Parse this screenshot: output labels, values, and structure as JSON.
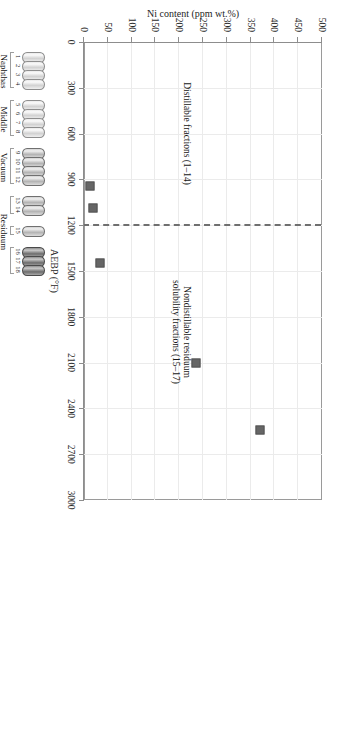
{
  "chart_data": {
    "type": "scatter",
    "title": "",
    "xlabel": "AEBP (°F)",
    "ylabel": "Ni content (ppm wt.%)",
    "xlim": [
      0,
      3000
    ],
    "ylim": [
      0,
      500
    ],
    "xticks": [
      0,
      300,
      600,
      900,
      1200,
      1500,
      1800,
      2100,
      2400,
      2700,
      3000
    ],
    "yticks": [
      0,
      50,
      100,
      150,
      200,
      250,
      300,
      350,
      400,
      450,
      500
    ],
    "grid": true,
    "legend": "none",
    "orientation": "rotated-90",
    "points": [
      {
        "label": "18",
        "x": 2540,
        "y": 370
      },
      {
        "label": "17",
        "x": 2100,
        "y": 235
      },
      {
        "label": "16",
        "x": 1450,
        "y": 33
      },
      {
        "label": "15",
        "x": 1090,
        "y": 18
      },
      {
        "label": "14",
        "x": 940,
        "y": 12
      }
    ],
    "annotations": [
      {
        "id": "nondistillable",
        "text_line1": "Nondistillable residuum",
        "text_line2": "solubility fractions (15–17)",
        "x": 1900,
        "y": 215
      },
      {
        "id": "distillable",
        "text_line1": "Distillable fractions (1–14)",
        "text_line2": "",
        "x": 600,
        "y": 215
      }
    ],
    "divider": {
      "type": "dashed-vertical",
      "x": 1200
    }
  },
  "diagram": {
    "header_line1": "Crude oil",
    "header_line2": "fractions",
    "groups": [
      {
        "id": "naphthas",
        "label_line1": "Naphthas",
        "label_line2": "",
        "numbers": [
          "1",
          "2",
          "3",
          "4"
        ],
        "shade": "light"
      },
      {
        "id": "middle-distillates",
        "label_line1": "Middle",
        "label_line2": "distillates",
        "numbers": [
          "5",
          "6",
          "7",
          "8"
        ],
        "shade": "light"
      },
      {
        "id": "vacuum-gas-oils",
        "label_line1": "Vacuum",
        "label_line2": "gas oils",
        "numbers": [
          "9",
          "10",
          "11",
          "12"
        ],
        "shade": "mid"
      },
      {
        "id": "vacuum-gas-oils-tail",
        "label_line1": "",
        "label_line2": "",
        "numbers": [
          "13",
          "14"
        ],
        "shade": "mid"
      },
      {
        "id": "residuum-15",
        "label_line1": "Residuum",
        "label_line2": "solubility",
        "label_line3": "fractions",
        "numbers": [
          "15"
        ],
        "shade": "mid"
      },
      {
        "id": "residuum-16-18",
        "label_line1": "",
        "label_line2": "",
        "numbers": [
          "16",
          "17",
          "18"
        ],
        "shade": "dark"
      }
    ]
  },
  "colors": {
    "marker": "#666666",
    "axis": "#8d8d8d",
    "grid": "#ebebeb",
    "divider": "#6f6f6f",
    "text": "#1a1a1a"
  }
}
